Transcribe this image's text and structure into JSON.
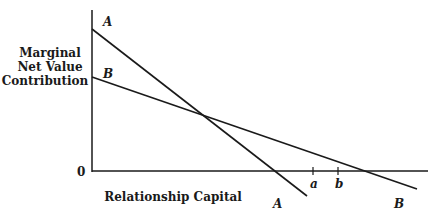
{
  "diagram": {
    "y_axis_label": [
      "Marginal",
      "Net Value",
      "Contribution"
    ],
    "x_axis_label": "Relationship Capital",
    "origin_label": "0",
    "lines": [
      {
        "name": "A",
        "start_label": "A",
        "end_label": "A"
      },
      {
        "name": "B",
        "start_label": "B",
        "end_label": "B"
      }
    ],
    "ticks": [
      {
        "label": "a"
      },
      {
        "label": "b"
      }
    ],
    "colors": {
      "line": "#1a1a1a",
      "background": "#ffffff"
    }
  }
}
